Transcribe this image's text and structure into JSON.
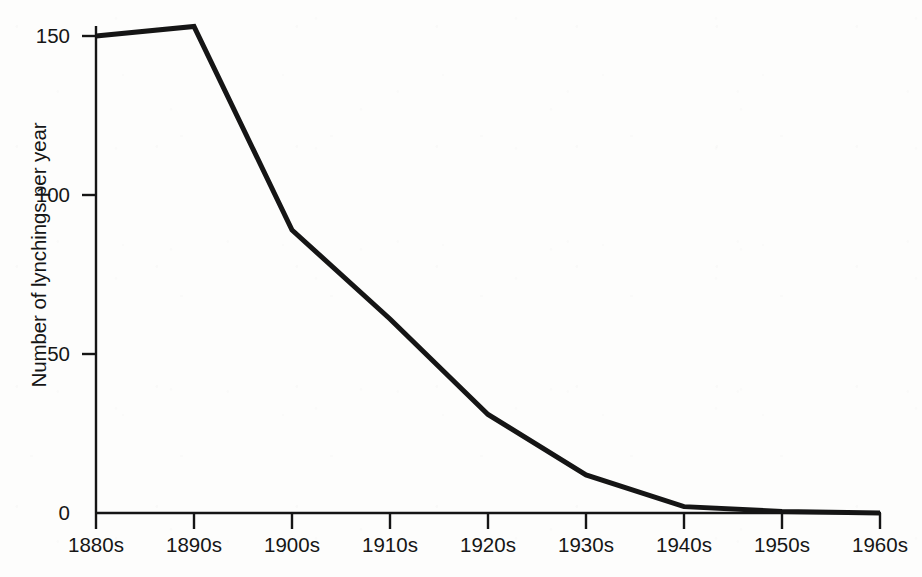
{
  "figure": {
    "background_color": "#fdfdfc",
    "ink_color": "#151515"
  },
  "chart_data": {
    "type": "line",
    "title": "",
    "subtitle": "",
    "xlabel": "",
    "ylabel": "Number of lynchings per year",
    "categories": [
      "1880s",
      "1890s",
      "1900s",
      "1910s",
      "1920s",
      "1930s",
      "1940s",
      "1950s",
      "1960s"
    ],
    "values": [
      150,
      153,
      89,
      61,
      31,
      12,
      2,
      0.5,
      0
    ],
    "series": [
      {
        "name": "Lynchings per year",
        "values": [
          150,
          153,
          89,
          61,
          31,
          12,
          2,
          0.5,
          0
        ],
        "color": "#151515",
        "line_width": 5
      }
    ],
    "xlim": [
      0,
      8
    ],
    "ylim": [
      0,
      160
    ],
    "ytick_values": [
      0,
      50,
      100,
      150
    ],
    "ytick_labels": [
      "0",
      "50",
      "100",
      "150"
    ],
    "xtick_labels": [
      "1880s",
      "1890s",
      "1900s",
      "1910s",
      "1920s",
      "1930s",
      "1940s",
      "1950s",
      "1960s"
    ],
    "grid": false,
    "legend": false,
    "legend_position": "none",
    "annotations": []
  },
  "axes": {
    "y_axis_title": "Number of lynchings per year",
    "y_tick_labels": [
      "150",
      "100",
      "50",
      "0"
    ],
    "x_tick_labels": [
      "1880s",
      "1890s",
      "1900s",
      "1910s",
      "1920s",
      "1930s",
      "1940s",
      "1950s",
      "1960s"
    ]
  },
  "caption": {
    "text": ""
  }
}
